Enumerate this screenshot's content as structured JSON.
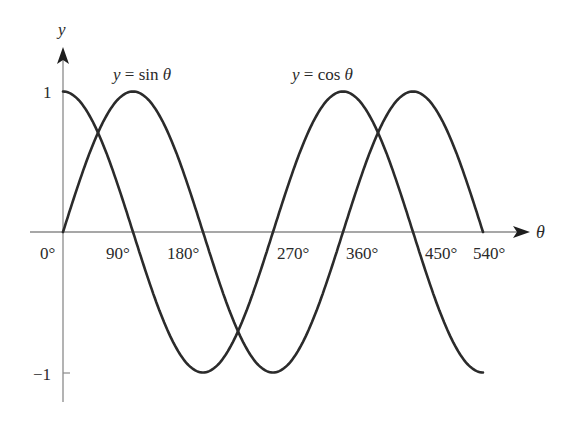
{
  "chart_data": {
    "type": "line",
    "title": "",
    "xlabel": "θ",
    "ylabel": "y",
    "x_unit": "degrees",
    "xlim": [
      0,
      540
    ],
    "ylim": [
      -1,
      1
    ],
    "grid": false,
    "legend": "inline labels above curves",
    "x_tick_labels": [
      "0°",
      "90°",
      "180°",
      "270°",
      "360°",
      "450°",
      "540°"
    ],
    "x_ticks": [
      0,
      90,
      180,
      270,
      360,
      450,
      540
    ],
    "y_tick_labels": [
      "1",
      "−1"
    ],
    "y_ticks": [
      1,
      -1
    ],
    "x": [
      0,
      90,
      180,
      270,
      360,
      450,
      540
    ],
    "series": [
      {
        "name": "y = sin θ",
        "values": [
          0,
          1,
          0,
          -1,
          0,
          1,
          0
        ]
      },
      {
        "name": "y = cos θ",
        "values": [
          1,
          0,
          -1,
          0,
          1,
          0,
          -1
        ]
      }
    ],
    "annotations": [
      {
        "text": "y = sin θ",
        "near_x": 90
      },
      {
        "text": "y = cos θ",
        "near_x": 360
      }
    ]
  },
  "labels": {
    "y_axis": "y",
    "x_axis": "θ",
    "sin_label": "y = sin θ",
    "cos_label": "y = cos θ",
    "y_pos": "1",
    "y_neg": "−1",
    "x0": "0°",
    "x90": "90°",
    "x180": "180°",
    "x270": "270°",
    "x360": "360°",
    "x450": "450°",
    "x540": "540°"
  },
  "colors": {
    "axis": "#8a8a8a",
    "curve": "#2b2b2b",
    "text": "#2a2a2a"
  }
}
